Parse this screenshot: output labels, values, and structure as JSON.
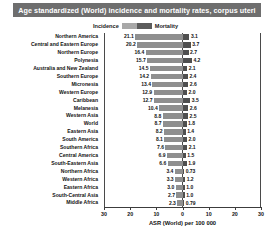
{
  "chart": {
    "title": "Age standardized (World) incidence and mortality rates, corpus uteri",
    "xlabel": "ASR (World) per 100 000",
    "legend": {
      "incidence_label": "Incidence",
      "mortality_label": "Mortality",
      "incidence_color": "#a8a8a8",
      "mortality_color": "#5c5c5c"
    },
    "title_bar_color": "#6e6e6e",
    "tick_labels": [
      "30",
      "20",
      "10",
      "0",
      "10",
      "20",
      "30"
    ]
  },
  "chart_data": {
    "type": "bar",
    "orientation": "horizontal-diverging",
    "title": "Age standardized (World) incidence and mortality rates, corpus uteri",
    "xlabel": "ASR (World) per 100 000",
    "ylabel": "",
    "xlim": [
      -35,
      35
    ],
    "grid": false,
    "legend_position": "top-center",
    "axis_ticks": [
      30,
      20,
      10,
      0,
      10,
      20,
      30
    ],
    "categories": [
      "Northern America",
      "Central and Eastern Europe",
      "Northern Europe",
      "Polynesia",
      "Australia and New Zealand",
      "Southern Europe",
      "Micronesia",
      "Western Europe",
      "Caribbean",
      "Melanesia",
      "Western Asia",
      "World",
      "Eastern Asia",
      "South America",
      "Southern Africa",
      "Central America",
      "South-Eastern Asia",
      "Northern Africa",
      "Western Africa",
      "Eastern Africa",
      "South-Central Asia",
      "Middle Africa"
    ],
    "series": [
      {
        "name": "Incidence",
        "direction": "left",
        "color": "#8f8f8f",
        "values": [
          21.1,
          20.2,
          16.4,
          15.7,
          14.5,
          14.2,
          13.4,
          12.9,
          12.7,
          10.4,
          8.8,
          8.7,
          8.2,
          8.1,
          7.6,
          6.9,
          6.6,
          3.4,
          3.3,
          3.0,
          2.7,
          2.3
        ]
      },
      {
        "name": "Mortality",
        "direction": "right",
        "color": "#4f4f4f",
        "values": [
          3.1,
          3.7,
          2.7,
          4.2,
          2.1,
          2.4,
          2.6,
          2.0,
          3.5,
          2.6,
          2.5,
          1.8,
          1.4,
          2.0,
          2.1,
          1.5,
          1.9,
          0.73,
          1.2,
          1.0,
          1.0,
          0.79
        ]
      }
    ],
    "rows": [
      {
        "region": "Northern America",
        "incidence": 21.1,
        "mortality": 3.1,
        "incidence_text": "21.1",
        "mortality_text": "3.1"
      },
      {
        "region": "Central and Eastern Europe",
        "incidence": 20.2,
        "mortality": 3.7,
        "incidence_text": "20.2",
        "mortality_text": "3.7"
      },
      {
        "region": "Northern Europe",
        "incidence": 16.4,
        "mortality": 2.7,
        "incidence_text": "16.4",
        "mortality_text": "2.7"
      },
      {
        "region": "Polynesia",
        "incidence": 15.7,
        "mortality": 4.2,
        "incidence_text": "15.7",
        "mortality_text": "4.2"
      },
      {
        "region": "Australia and New Zealand",
        "incidence": 14.5,
        "mortality": 2.1,
        "incidence_text": "14.5",
        "mortality_text": "2.1"
      },
      {
        "region": "Southern Europe",
        "incidence": 14.2,
        "mortality": 2.4,
        "incidence_text": "14.2",
        "mortality_text": "2.4"
      },
      {
        "region": "Micronesia",
        "incidence": 13.4,
        "mortality": 2.6,
        "incidence_text": "13.4",
        "mortality_text": "2.6"
      },
      {
        "region": "Western Europe",
        "incidence": 12.9,
        "mortality": 2.0,
        "incidence_text": "12.9",
        "mortality_text": "2.0"
      },
      {
        "region": "Caribbean",
        "incidence": 12.7,
        "mortality": 3.5,
        "incidence_text": "12.7",
        "mortality_text": "3.5"
      },
      {
        "region": "Melanesia",
        "incidence": 10.4,
        "mortality": 2.6,
        "incidence_text": "10.4",
        "mortality_text": "2.6"
      },
      {
        "region": "Western Asia",
        "incidence": 8.8,
        "mortality": 2.5,
        "incidence_text": "8.8",
        "mortality_text": "2.5"
      },
      {
        "region": "World",
        "incidence": 8.7,
        "mortality": 1.8,
        "incidence_text": "8.7",
        "mortality_text": "1.8"
      },
      {
        "region": "Eastern Asia",
        "incidence": 8.2,
        "mortality": 1.4,
        "incidence_text": "8.2",
        "mortality_text": "1.4"
      },
      {
        "region": "South America",
        "incidence": 8.1,
        "mortality": 2.0,
        "incidence_text": "8.1",
        "mortality_text": "2.0"
      },
      {
        "region": "Southern Africa",
        "incidence": 7.6,
        "mortality": 2.1,
        "incidence_text": "7.6",
        "mortality_text": "2.1"
      },
      {
        "region": "Central America",
        "incidence": 6.9,
        "mortality": 1.5,
        "incidence_text": "6.9",
        "mortality_text": "1.5"
      },
      {
        "region": "South-Eastern Asia",
        "incidence": 6.6,
        "mortality": 1.9,
        "incidence_text": "6.6",
        "mortality_text": "1.9"
      },
      {
        "region": "Northern Africa",
        "incidence": 3.4,
        "mortality": 0.73,
        "incidence_text": "3.4",
        "mortality_text": "0.73"
      },
      {
        "region": "Western Africa",
        "incidence": 3.3,
        "mortality": 1.2,
        "incidence_text": "3.3",
        "mortality_text": "1.2"
      },
      {
        "region": "Eastern Africa",
        "incidence": 3.0,
        "mortality": 1.0,
        "incidence_text": "3.0",
        "mortality_text": "1.0"
      },
      {
        "region": "South-Central Asia",
        "incidence": 2.7,
        "mortality": 1.0,
        "incidence_text": "2.7",
        "mortality_text": "1.0"
      },
      {
        "region": "Middle Africa",
        "incidence": 2.3,
        "mortality": 0.79,
        "incidence_text": "2.3",
        "mortality_text": "0.79"
      }
    ]
  }
}
